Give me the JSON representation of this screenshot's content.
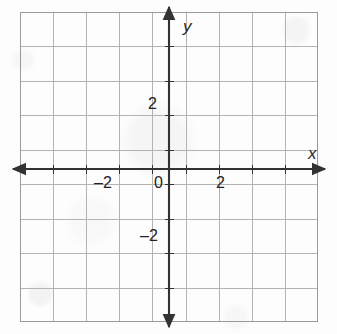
{
  "figure": {
    "kind": "cartesian-coordinate-grid",
    "background_color": "#fdfdfd"
  },
  "colors": {
    "grid_line": "#b3b3b3",
    "grid_border": "#9a9a9a",
    "axis_line": "#333333",
    "label_text": "#232323",
    "axis_name_text": "#2b2b2b"
  },
  "axes": {
    "x_axis": {
      "name": "x",
      "name_position": "right-above-arrow",
      "arrow_start": true,
      "arrow_end": true,
      "range": [
        -4.5,
        4.5
      ],
      "tick_interval": 1,
      "labeled_ticks": [
        {
          "value": -2,
          "label": "–2"
        },
        {
          "value": 2,
          "label": "2"
        }
      ]
    },
    "y_axis": {
      "name": "y",
      "name_position": "right-of-arrow",
      "arrow_start": true,
      "arrow_end": true,
      "range": [
        -4.5,
        4.5
      ],
      "tick_interval": 1,
      "labeled_ticks": [
        {
          "value": 2,
          "label": "2"
        },
        {
          "value": -2,
          "label": "–2"
        }
      ]
    },
    "origin_label": "0"
  },
  "grid": {
    "columns": 9,
    "rows": 9,
    "cell_size_px": 33.1,
    "show_border": true,
    "show_minor_lines": false
  },
  "chart_data": {
    "type": "scatter",
    "title": "",
    "subtitle": "",
    "xlabel": "x",
    "ylabel": "y",
    "xlim": [
      -4.5,
      4.5
    ],
    "ylim": [
      -4.5,
      4.5
    ],
    "xticks": [
      -4,
      -3,
      -2,
      -1,
      0,
      1,
      2,
      3,
      4
    ],
    "yticks": [
      -4,
      -3,
      -2,
      -1,
      0,
      1,
      2,
      3,
      4
    ],
    "xticklabels": [
      "",
      "",
      "–2",
      "",
      "0",
      "",
      "2",
      "",
      ""
    ],
    "yticklabels": [
      "",
      "",
      "–2",
      "",
      "",
      "",
      "2",
      "",
      ""
    ],
    "grid": true,
    "legend": null,
    "series": [],
    "annotations": [],
    "note": "Empty blank coordinate plane — no plotted data points, lines or curves."
  }
}
